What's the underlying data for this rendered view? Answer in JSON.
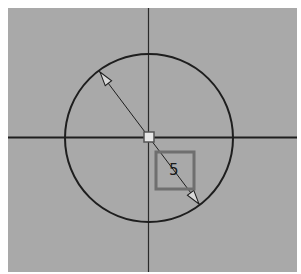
{
  "canvas": {
    "background": "#a9a9a9",
    "frame": "#ffffff"
  },
  "axes": {
    "color": "#1e1e1e"
  },
  "circle": {
    "color": "#1e1e1e"
  },
  "dimension": {
    "type": "diameter",
    "value": "5",
    "box_color": "#6f6f6f"
  },
  "center_marker": {
    "fill": "#e8e8e8",
    "stroke": "#555555"
  }
}
